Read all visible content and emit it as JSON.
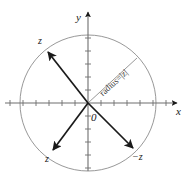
{
  "figure": {
    "width": 188,
    "height": 175,
    "background": "#ffffff",
    "stroke_dark": "#1a1a1a",
    "stroke_light": "#8c8c8c"
  },
  "axes": {
    "x_label": "x",
    "y_label": "y",
    "origin_label": "0",
    "x_axis_y": 103,
    "y_axis_x": 88,
    "tick_spacing": 13,
    "tick_half_length": 3
  },
  "circle": {
    "center_x": 88,
    "center_y": 103,
    "radius": 68,
    "color": "#8c8c8c"
  },
  "radius_annotation": {
    "text": "radius=|z|",
    "from_x": 88,
    "from_y": 103,
    "to_x": 137,
    "to_y": 58,
    "color": "#8c8c8c",
    "angle_deg": -42
  },
  "vectors": [
    {
      "name": "z-upper-left",
      "label": "z",
      "from_x": 88,
      "from_y": 103,
      "to_x": 48,
      "to_y": 52,
      "label_x": 38,
      "label_y": 36
    },
    {
      "name": "z-lower-left",
      "label": "z",
      "from_x": 88,
      "from_y": 103,
      "to_x": 53,
      "to_y": 150,
      "label_x": 45,
      "label_y": 154
    },
    {
      "name": "minus-z-lower-right",
      "label": "−z",
      "from_x": 88,
      "from_y": 103,
      "to_x": 133,
      "to_y": 148,
      "label_x": 132,
      "label_y": 152
    }
  ]
}
